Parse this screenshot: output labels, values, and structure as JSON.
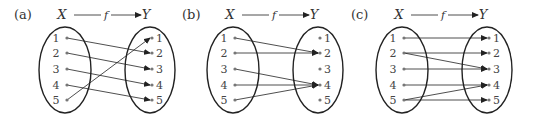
{
  "set_x_label": "X",
  "set_y_label": "Y",
  "function_label": "f",
  "elements": [
    "1",
    "2",
    "3",
    "4",
    "5"
  ],
  "colors": {
    "line": "#222222",
    "dot": "#777777",
    "text": "#333333"
  },
  "diagrams": [
    {
      "label": "(a)",
      "offset_x": 0,
      "mappings": [
        [
          1,
          2
        ],
        [
          2,
          3
        ],
        [
          3,
          4
        ],
        [
          4,
          5
        ],
        [
          5,
          1
        ]
      ]
    },
    {
      "label": "(b)",
      "offset_x": 168,
      "mappings": [
        [
          1,
          2
        ],
        [
          2,
          2
        ],
        [
          3,
          4
        ],
        [
          4,
          4
        ],
        [
          5,
          4
        ]
      ]
    },
    {
      "label": "(c)",
      "offset_x": 337,
      "mappings": [
        [
          1,
          1
        ],
        [
          2,
          2
        ],
        [
          2,
          3
        ],
        [
          3,
          3
        ],
        [
          4,
          4
        ],
        [
          5,
          4
        ],
        [
          5,
          5
        ]
      ]
    }
  ]
}
